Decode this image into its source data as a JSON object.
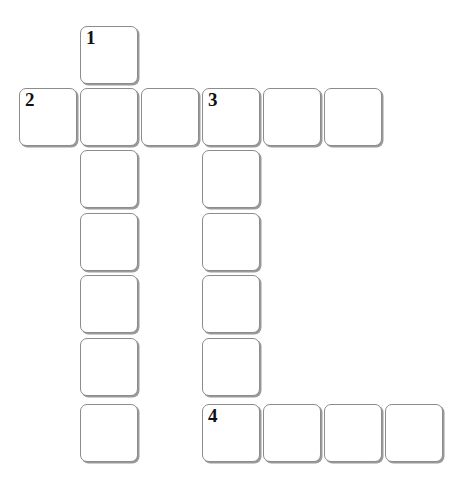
{
  "puzzle": {
    "type": "crossword-grid",
    "title": "",
    "columns": 7,
    "rows": 7,
    "cell_size_px": 61,
    "origin_px": {
      "x": 19,
      "y": 26
    },
    "colors": {
      "background": "#ffffff",
      "cell_fill": "#ffffff",
      "cell_border": "#8c8c8c",
      "cell_shadow": "#9a9a9a",
      "number_text": "#111111"
    },
    "column_x_px": [
      19,
      80,
      141,
      202,
      263,
      324,
      385
    ],
    "row_y_px": [
      26,
      88,
      150,
      213,
      275,
      338,
      404
    ],
    "numbers_visible": [
      "1",
      "2",
      "3",
      "4"
    ],
    "cells": [
      {
        "row": 0,
        "col": 1,
        "number": "1",
        "letter": ""
      },
      {
        "row": 1,
        "col": 0,
        "number": "2",
        "letter": ""
      },
      {
        "row": 1,
        "col": 1,
        "number": "",
        "letter": ""
      },
      {
        "row": 1,
        "col": 2,
        "number": "",
        "letter": ""
      },
      {
        "row": 1,
        "col": 3,
        "number": "3",
        "letter": ""
      },
      {
        "row": 1,
        "col": 4,
        "number": "",
        "letter": ""
      },
      {
        "row": 1,
        "col": 5,
        "number": "",
        "letter": ""
      },
      {
        "row": 2,
        "col": 1,
        "number": "",
        "letter": ""
      },
      {
        "row": 2,
        "col": 3,
        "number": "",
        "letter": ""
      },
      {
        "row": 3,
        "col": 1,
        "number": "",
        "letter": ""
      },
      {
        "row": 3,
        "col": 3,
        "number": "",
        "letter": ""
      },
      {
        "row": 4,
        "col": 1,
        "number": "",
        "letter": ""
      },
      {
        "row": 4,
        "col": 3,
        "number": "",
        "letter": ""
      },
      {
        "row": 5,
        "col": 1,
        "number": "",
        "letter": ""
      },
      {
        "row": 5,
        "col": 3,
        "number": "",
        "letter": ""
      },
      {
        "row": 6,
        "col": 1,
        "number": "",
        "letter": ""
      },
      {
        "row": 6,
        "col": 3,
        "number": "4",
        "letter": ""
      },
      {
        "row": 6,
        "col": 4,
        "number": "",
        "letter": ""
      },
      {
        "row": 6,
        "col": 5,
        "number": "",
        "letter": ""
      },
      {
        "row": 6,
        "col": 6,
        "number": "",
        "letter": ""
      }
    ],
    "entries": [
      {
        "number": "1",
        "direction": "down",
        "length": 7,
        "start": {
          "row": 0,
          "col": 1
        }
      },
      {
        "number": "2",
        "direction": "across",
        "length": 6,
        "start": {
          "row": 1,
          "col": 0
        }
      },
      {
        "number": "3",
        "direction": "down",
        "length": 6,
        "start": {
          "row": 1,
          "col": 3
        }
      },
      {
        "number": "4",
        "direction": "across",
        "length": 4,
        "start": {
          "row": 6,
          "col": 3
        }
      }
    ]
  }
}
